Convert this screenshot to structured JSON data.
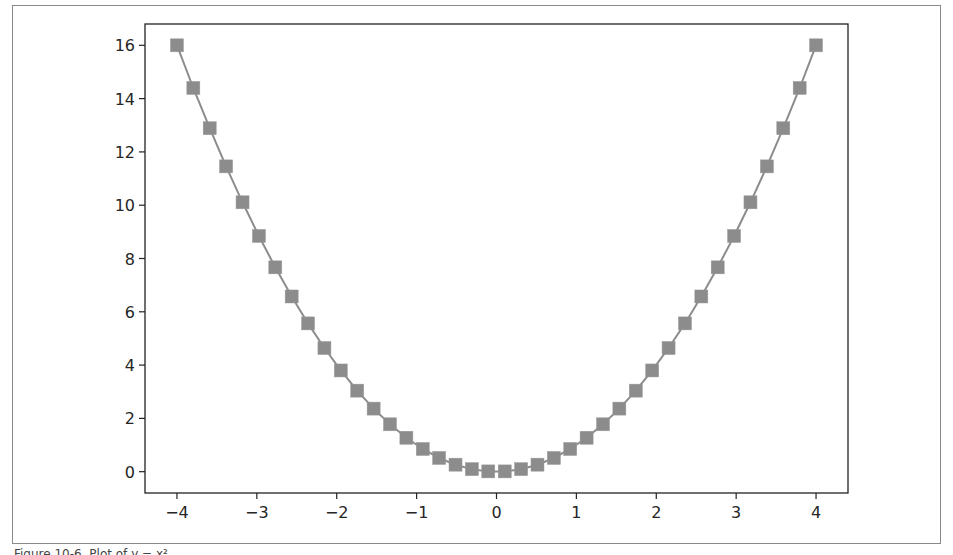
{
  "figure": {
    "caption": "Figure 10-6. Plot of y = x²"
  },
  "chart_data": {
    "type": "line",
    "title": "",
    "xlabel": "",
    "ylabel": "",
    "xlim": [
      -4.4,
      4.4
    ],
    "ylim": [
      -0.8,
      16.8
    ],
    "grid": false,
    "legend": null,
    "marker": "square",
    "line_color": "#8c8c8c",
    "marker_color": "#8c8c8c",
    "x_ticks": [
      -4,
      -3,
      -2,
      -1,
      0,
      1,
      2,
      3,
      4
    ],
    "x_tick_labels": [
      "−4",
      "−3",
      "−2",
      "−1",
      "0",
      "1",
      "2",
      "3",
      "4"
    ],
    "y_ticks": [
      0,
      2,
      4,
      6,
      8,
      10,
      12,
      14,
      16
    ],
    "y_tick_labels": [
      "0",
      "2",
      "4",
      "6",
      "8",
      "10",
      "12",
      "14",
      "16"
    ],
    "series": [
      {
        "name": "y = x^2",
        "x": [
          -4.0,
          -3.795,
          -3.59,
          -3.385,
          -3.179,
          -2.974,
          -2.769,
          -2.564,
          -2.359,
          -2.154,
          -1.949,
          -1.744,
          -1.538,
          -1.333,
          -1.128,
          -0.923,
          -0.718,
          -0.513,
          -0.308,
          -0.103,
          0.103,
          0.308,
          0.513,
          0.718,
          0.923,
          1.128,
          1.333,
          1.538,
          1.744,
          1.949,
          2.154,
          2.359,
          2.564,
          2.769,
          2.974,
          3.179,
          3.385,
          3.59,
          3.795,
          4.0
        ],
        "y": [
          16.0,
          14.4,
          12.888,
          11.457,
          10.109,
          8.846,
          7.668,
          6.575,
          5.565,
          4.64,
          3.799,
          3.041,
          2.367,
          1.778,
          1.273,
          0.852,
          0.515,
          0.263,
          0.095,
          0.011,
          0.011,
          0.095,
          0.263,
          0.515,
          0.852,
          1.273,
          1.778,
          2.367,
          3.041,
          3.799,
          4.64,
          5.565,
          6.575,
          7.668,
          8.846,
          10.109,
          11.457,
          12.888,
          14.4,
          16.0
        ]
      }
    ]
  }
}
